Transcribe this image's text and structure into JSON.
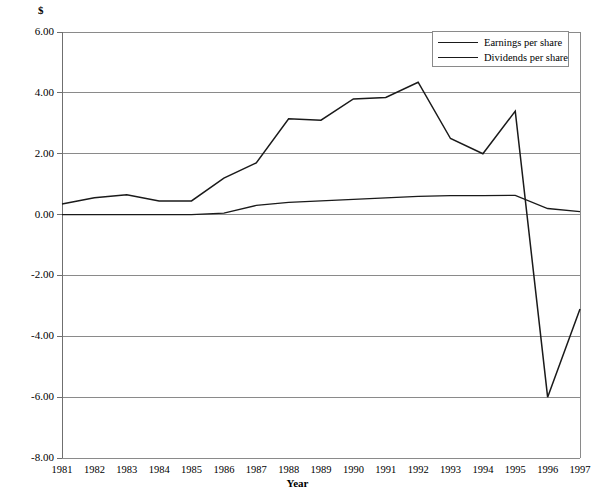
{
  "chart_data": {
    "type": "line",
    "title": "",
    "xlabel": "Year",
    "ylabel": "$",
    "ylim": [
      -8,
      6
    ],
    "xlim": [
      1981,
      1997
    ],
    "grid": true,
    "legend_position": "top-right",
    "categories": [
      1981,
      1982,
      1983,
      1984,
      1985,
      1986,
      1987,
      1988,
      1989,
      1990,
      1991,
      1992,
      1993,
      1994,
      1995,
      1996,
      1997
    ],
    "yticks": [
      "6.00",
      "4.00",
      "2.00",
      "0.00",
      "-2.00",
      "-4.00",
      "-6.00",
      "-8.00"
    ],
    "ytick_values": [
      6,
      4,
      2,
      0,
      -2,
      -4,
      -6,
      -8
    ],
    "xticks": [
      "1981",
      "1982",
      "1983",
      "1984",
      "1985",
      "1986",
      "1987",
      "1988",
      "1989",
      "1990",
      "1991",
      "1992",
      "1993",
      "1994",
      "1995",
      "1996",
      "1997"
    ],
    "series": [
      {
        "name": "Earnings per share",
        "color": "#1a1a1a",
        "values": [
          0.35,
          0.55,
          0.65,
          0.45,
          0.45,
          1.2,
          1.7,
          3.15,
          3.1,
          3.8,
          3.85,
          4.35,
          2.5,
          2.0,
          3.4,
          -6.0,
          -3.1
        ]
      },
      {
        "name": "Dividends per share",
        "color": "#1a1a1a",
        "values": [
          0.0,
          0.0,
          0.0,
          0.0,
          0.0,
          0.05,
          0.3,
          0.4,
          0.45,
          0.5,
          0.55,
          0.6,
          0.62,
          0.62,
          0.63,
          0.2,
          0.1
        ]
      }
    ]
  },
  "legend": {
    "items": [
      {
        "label": "Earnings per share"
      },
      {
        "label": "Dividends per share"
      }
    ]
  },
  "axes": {
    "y_unit": "$",
    "x_title": "Year"
  }
}
